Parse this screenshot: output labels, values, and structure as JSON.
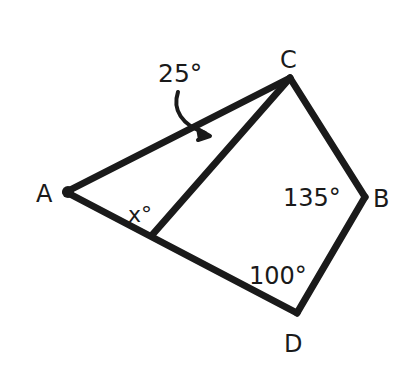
{
  "diagram": {
    "type": "geometry-quadrilateral",
    "stroke_color": "#1a1a1a",
    "background": "#ffffff",
    "vertices": {
      "A": {
        "label": "A",
        "x": 66,
        "y": 192
      },
      "B": {
        "label": "B",
        "x": 365,
        "y": 197
      },
      "C": {
        "label": "C",
        "x": 290,
        "y": 78
      },
      "D": {
        "label": "D",
        "x": 297,
        "y": 313
      }
    },
    "interior_point": {
      "x": 153,
      "y": 234
    },
    "angle_labels": {
      "c_angle": "25°",
      "a_x_angle": "x°",
      "b_angle": "135°",
      "d_angle": "100°"
    }
  }
}
